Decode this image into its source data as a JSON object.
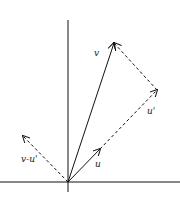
{
  "diagram": {
    "labels": {
      "v": "v",
      "u": "u",
      "u_prime": "u'",
      "v_minus_u_prime": "v-u'"
    },
    "colors": {
      "stroke": "#111111",
      "background": "#ffffff"
    },
    "vectors": [
      {
        "name": "v",
        "from": [
          68,
          182
        ],
        "to": [
          114,
          43
        ],
        "style": "solid"
      },
      {
        "name": "u",
        "from": [
          68,
          182
        ],
        "to": [
          100,
          149
        ],
        "style": "solid"
      },
      {
        "name": "u'",
        "from": [
          100,
          149
        ],
        "to": [
          157,
          90
        ],
        "style": "dashed"
      },
      {
        "name": "v-u'",
        "from": [
          68,
          182
        ],
        "to": [
          23,
          136
        ],
        "style": "dashed"
      },
      {
        "name": "v-to-u' connector",
        "from": [
          157,
          90
        ],
        "to": [
          114,
          43
        ],
        "style": "dashed"
      }
    ]
  }
}
